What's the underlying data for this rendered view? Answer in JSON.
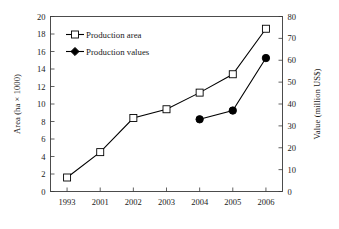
{
  "chart_data": {
    "type": "line",
    "title": "",
    "subtitle": "",
    "xlabel": "",
    "categories": [
      "1993",
      "2001",
      "2002",
      "2003",
      "2004",
      "2005",
      "2006"
    ],
    "grid": false,
    "legend_position": "upper-left-inside",
    "axes": {
      "left": {
        "label": "Area (ha × 1000)",
        "ticks": [
          "0",
          "2",
          "4",
          "6",
          "8",
          "10",
          "12",
          "14",
          "16",
          "18",
          "20"
        ],
        "tick_values": [
          0,
          2,
          4,
          6,
          8,
          10,
          12,
          14,
          16,
          18,
          20
        ],
        "lim": [
          0,
          20
        ]
      },
      "right": {
        "label": "Value (million US$)",
        "ticks": [
          "0",
          "10",
          "20",
          "30",
          "40",
          "50",
          "60",
          "70",
          "80"
        ],
        "tick_values": [
          0,
          10,
          20,
          30,
          40,
          50,
          60,
          70,
          80
        ],
        "lim": [
          0,
          80
        ]
      }
    },
    "series": [
      {
        "name": "Production area",
        "axis": "left",
        "marker": "open-square",
        "x": [
          "1993",
          "2001",
          "2002",
          "2003",
          "2004",
          "2005",
          "2006"
        ],
        "values": [
          1.6,
          4.5,
          8.4,
          9.4,
          11.3,
          13.4,
          18.6
        ]
      },
      {
        "name": "Production values",
        "axis": "right",
        "marker": "filled-circle",
        "x": [
          "2004",
          "2005",
          "2006"
        ],
        "values": [
          33,
          37,
          61
        ]
      }
    ]
  },
  "legend": {
    "entries": [
      {
        "label": "Production area"
      },
      {
        "label": "Production values"
      }
    ]
  },
  "colors": {
    "line": "#000000",
    "frame": "#3a3a3a",
    "background": "#ffffff",
    "marker_fill_open": "#ffffff",
    "marker_fill_solid": "#000000"
  }
}
